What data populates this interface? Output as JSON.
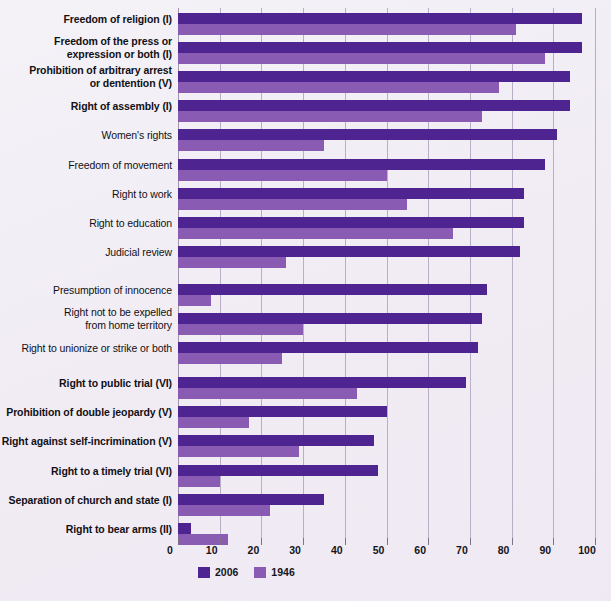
{
  "legend": {
    "position": "bottom-left",
    "entries": [
      {
        "label": "2006",
        "color": "#4d2490",
        "key": "v2006"
      },
      {
        "label": "1946",
        "color": "#8a5bb2",
        "key": "v1946"
      }
    ]
  },
  "axis": {
    "ticks": [
      "0",
      "10",
      "20",
      "30",
      "40",
      "50",
      "60",
      "70",
      "80",
      "90",
      "100"
    ]
  },
  "chart_data": {
    "type": "bar",
    "orientation": "horizontal",
    "title": "",
    "subtitle": "",
    "xlabel": "",
    "ylabel": "",
    "xlim": [
      0,
      100
    ],
    "xticks": [
      0,
      10,
      20,
      30,
      40,
      50,
      60,
      70,
      80,
      90,
      100
    ],
    "grid": true,
    "legend_position": "bottom-left",
    "categories": [
      "Freedom of religion (I)",
      "Freedom of the press or expression or both (I)",
      "Prohibition of arbitrary arrest or dentention (V)",
      "Right of assembly (I)",
      "Women's rights",
      "Freedom of movement",
      "Right to work",
      "Right to education",
      "Judicial review",
      "Presumption of innocence",
      "Right not to be expelled from home territory",
      "Right to unionize or strike or both",
      "Right to public trial (VI)",
      "Prohibition of double jeopardy (V)",
      "Right against self-incrimination (V)",
      "Right to a timely trial (VI)",
      "Separation of church and state (I)",
      "Right to bear arms (II)"
    ],
    "series": [
      {
        "name": "2006",
        "color": "#4d2490",
        "values": [
          97,
          97,
          94,
          94,
          91,
          88,
          83,
          83,
          82,
          74,
          73,
          72,
          69,
          50,
          47,
          48,
          35,
          3
        ]
      },
      {
        "name": "1946",
        "color": "#8a5bb2",
        "values": [
          81,
          88,
          77,
          73,
          35,
          50,
          55,
          66,
          26,
          8,
          30,
          25,
          43,
          17,
          29,
          10,
          22,
          12
        ]
      }
    ]
  },
  "rows": [
    {
      "label": "Freedom of religion (I)",
      "bold": true,
      "lines": 1,
      "v2006": 97,
      "v1946": 81
    },
    {
      "label": "Freedom of the press or expression or both (I)",
      "bold": true,
      "lines": 2,
      "line1": "Freedom of the press or",
      "line2": "expression or both (I)",
      "v2006": 97,
      "v1946": 88
    },
    {
      "label": "Prohibition of arbitrary arrest or dentention (V)",
      "bold": true,
      "lines": 2,
      "line1": "Prohibition of arbitrary arrest",
      "line2": "or dentention (V)",
      "v2006": 94,
      "v1946": 77
    },
    {
      "label": "Right of assembly (I)",
      "bold": true,
      "lines": 1,
      "v2006": 94,
      "v1946": 73
    },
    {
      "label": "Women's rights",
      "bold": false,
      "lines": 1,
      "v2006": 91,
      "v1946": 35
    },
    {
      "label": "Freedom of movement",
      "bold": false,
      "lines": 1,
      "v2006": 88,
      "v1946": 50
    },
    {
      "label": "Right to work",
      "bold": false,
      "lines": 1,
      "v2006": 83,
      "v1946": 55
    },
    {
      "label": "Right to education",
      "bold": false,
      "lines": 1,
      "v2006": 83,
      "v1946": 66
    },
    {
      "label": "Judicial review",
      "bold": false,
      "lines": 1,
      "v2006": 82,
      "v1946": 26
    },
    {
      "label": "Presumption of innocence",
      "bold": false,
      "lines": 1,
      "v2006": 74,
      "v1946": 8
    },
    {
      "label": "Right not to be expelled from home territory",
      "bold": false,
      "lines": 2,
      "line1": "Right not to be expelled",
      "line2": "from home territory",
      "v2006": 73,
      "v1946": 30
    },
    {
      "label": "Right to unionize or strike or both",
      "bold": false,
      "lines": 1,
      "v2006": 72,
      "v1946": 25
    },
    {
      "label": "Right to public trial (VI)",
      "bold": true,
      "lines": 1,
      "v2006": 69,
      "v1946": 43
    },
    {
      "label": "Prohibition of double jeopardy (V)",
      "bold": true,
      "lines": 1,
      "v2006": 50,
      "v1946": 17
    },
    {
      "label": "Right against self-incrimination (V)",
      "bold": true,
      "lines": 1,
      "v2006": 47,
      "v1946": 29
    },
    {
      "label": "Right to a timely trial (VI)",
      "bold": true,
      "lines": 1,
      "v2006": 48,
      "v1946": 10
    },
    {
      "label": "Separation of church and state (I)",
      "bold": true,
      "lines": 1,
      "v2006": 35,
      "v1946": 22
    },
    {
      "label": "Right to bear arms (II)",
      "bold": true,
      "lines": 1,
      "v2006": 3,
      "v1946": 12
    }
  ]
}
